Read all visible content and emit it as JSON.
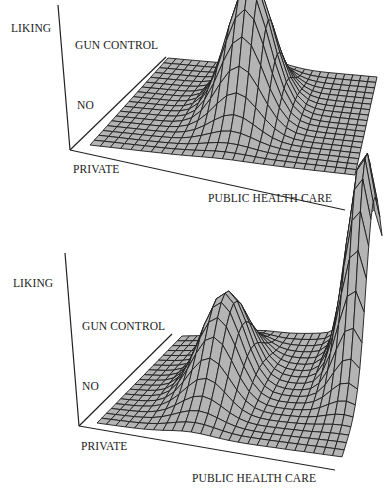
{
  "chart_data": [
    {
      "type": "surface3d",
      "title": "",
      "zlabel": "LIKING",
      "xlabel": "PUBLIC HEALTH CARE",
      "x_low_label": "PRIVATE",
      "ylabel": "GUN CONTROL",
      "y_low_label": "NO",
      "grid_resolution": [
        26,
        18
      ],
      "grid": "wireframe mesh, gray faces",
      "peaks": [
        {
          "x": 0.5,
          "y": 0.55,
          "height": 1.0,
          "sigma_x": 0.09,
          "sigma_y": 0.18,
          "description": "single central peak"
        }
      ]
    },
    {
      "type": "surface3d",
      "title": "",
      "zlabel": "LIKING",
      "xlabel": "PUBLIC HEALTH CARE",
      "x_low_label": "PRIVATE",
      "ylabel": "GUN CONTROL",
      "y_low_label": "NO",
      "grid_resolution": [
        26,
        18
      ],
      "grid": "wireframe mesh, gray faces",
      "peaks": [
        {
          "x": 0.38,
          "y": 0.5,
          "height": 0.45,
          "sigma_x": 0.09,
          "sigma_y": 0.2,
          "description": "smaller peak at middle"
        },
        {
          "x": 0.95,
          "y": 0.8,
          "height": 1.0,
          "sigma_x": 0.07,
          "sigma_y": 0.2,
          "description": "tall peak at high public health care / high gun control"
        }
      ]
    }
  ],
  "panels": [
    {
      "labels": {
        "liking": "LIKING",
        "gun_control": "GUN CONTROL",
        "no": "NO",
        "private": "PRIVATE",
        "public_health_care": "PUBLIC HEALTH CARE"
      }
    },
    {
      "labels": {
        "liking": "LIKING",
        "gun_control": "GUN CONTROL",
        "no": "NO",
        "private": "PRIVATE",
        "public_health_care": "PUBLIC HEALTH CARE"
      }
    }
  ],
  "colors": {
    "mesh_fill": "#b4b4b4",
    "mesh_line": "#1c1c1c",
    "axis": "#222222",
    "background": "#ffffff"
  }
}
